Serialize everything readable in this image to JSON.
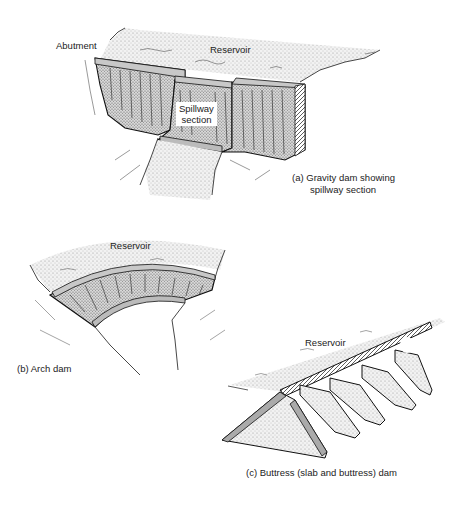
{
  "figure": {
    "panels": [
      {
        "id": "a",
        "caption_line1": "(a)  Gravity dam showing",
        "caption_line2": "spillway section",
        "labels": {
          "abutment": "Abutment",
          "reservoir": "Reservoir",
          "spillway_line1": "Spillway",
          "spillway_line2": "section"
        }
      },
      {
        "id": "b",
        "caption": "(b)  Arch dam",
        "labels": {
          "reservoir": "Reservoir"
        }
      },
      {
        "id": "c",
        "caption": "(c)  Buttress (slab and buttress) dam",
        "labels": {
          "reservoir": "Reservoir"
        }
      }
    ],
    "colors": {
      "ink": "#1a1a1a",
      "dam_fill": "#9a9a9a",
      "dam_top": "#c4c4c4",
      "water": "#e6e6e6",
      "ground": "#d0d0d0"
    }
  }
}
